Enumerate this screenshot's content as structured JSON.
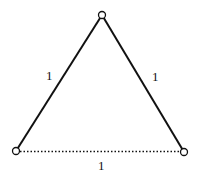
{
  "diagram": {
    "type": "triangle",
    "vertices": [
      {
        "id": "top",
        "x": 102,
        "y": 15
      },
      {
        "id": "bottom-left",
        "x": 16,
        "y": 151
      },
      {
        "id": "bottom-right",
        "x": 184,
        "y": 152
      }
    ],
    "edges": [
      {
        "id": "left",
        "from": "bottom-left",
        "to": "top",
        "style": "solid",
        "label": "1"
      },
      {
        "id": "right",
        "from": "top",
        "to": "bottom-right",
        "style": "solid",
        "label": "1"
      },
      {
        "id": "bottom",
        "from": "bottom-left",
        "to": "bottom-right",
        "style": "dotted",
        "label": "1"
      }
    ],
    "colors": {
      "stroke": "#111111",
      "background": "#ffffff"
    }
  }
}
